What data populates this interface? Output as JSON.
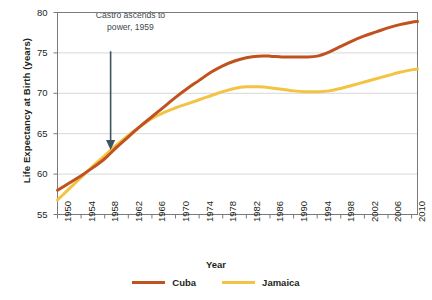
{
  "chart_data": {
    "type": "line",
    "title": "",
    "xlabel": "Year",
    "ylabel": "Life Expectancy at Birth (years)",
    "xlim": [
      1950,
      2011
    ],
    "ylim": [
      55,
      80
    ],
    "yticks": [
      55,
      60,
      65,
      70,
      75,
      80
    ],
    "xticks": [
      1950,
      1954,
      1958,
      1962,
      1966,
      1970,
      1974,
      1978,
      1982,
      1986,
      1990,
      1994,
      1998,
      2002,
      2006,
      2010
    ],
    "grid": "horizontal",
    "legend_position": "bottom-center",
    "annotations": [
      {
        "text": "Castro ascends to power, 1959",
        "line1": "Castro ascends to",
        "line2": "power, 1959",
        "arrow_x": 1959,
        "arrow_y_from": 75.2,
        "arrow_y_to": 63.1,
        "color": "#3d5560"
      }
    ],
    "series": [
      {
        "name": "Cuba",
        "color": "#C0521F",
        "x": [
          1950,
          1952,
          1954,
          1956,
          1958,
          1960,
          1962,
          1964,
          1966,
          1968,
          1970,
          1972,
          1974,
          1976,
          1978,
          1980,
          1982,
          1984,
          1986,
          1988,
          1990,
          1992,
          1994,
          1996,
          1998,
          2000,
          2002,
          2004,
          2006,
          2008,
          2010,
          2011
        ],
        "values": [
          58.0,
          58.9,
          59.8,
          60.8,
          61.9,
          63.3,
          64.6,
          65.9,
          67.1,
          68.3,
          69.5,
          70.6,
          71.6,
          72.6,
          73.4,
          74.0,
          74.4,
          74.6,
          74.6,
          74.5,
          74.5,
          74.5,
          74.6,
          75.1,
          75.8,
          76.5,
          77.1,
          77.6,
          78.1,
          78.5,
          78.8,
          78.9
        ]
      },
      {
        "name": "Jamaica",
        "color": "#F3C344",
        "x": [
          1950,
          1952,
          1954,
          1956,
          1958,
          1960,
          1962,
          1964,
          1966,
          1968,
          1970,
          1972,
          1974,
          1976,
          1978,
          1980,
          1982,
          1984,
          1986,
          1988,
          1990,
          1992,
          1994,
          1996,
          1998,
          2000,
          2002,
          2004,
          2006,
          2008,
          2010,
          2011
        ],
        "values": [
          56.8,
          58.2,
          59.6,
          61.0,
          62.3,
          63.6,
          64.8,
          65.9,
          66.9,
          67.6,
          68.2,
          68.7,
          69.2,
          69.7,
          70.2,
          70.6,
          70.8,
          70.8,
          70.7,
          70.5,
          70.3,
          70.2,
          70.2,
          70.3,
          70.6,
          71.0,
          71.4,
          71.8,
          72.2,
          72.6,
          72.9,
          73.0
        ]
      }
    ]
  },
  "legend": {
    "items": [
      {
        "label": "Cuba",
        "color": "#C0521F"
      },
      {
        "label": "Jamaica",
        "color": "#F3C344"
      }
    ]
  },
  "axes": {
    "y_title": "Life Expectancy at Birth (years)",
    "x_title": "Year"
  }
}
